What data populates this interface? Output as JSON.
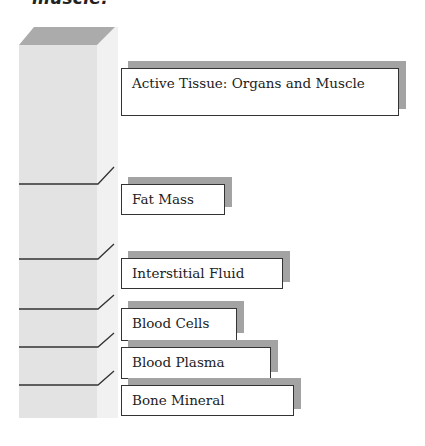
{
  "caption": "muscle.",
  "diagram": {
    "title_hidden": "",
    "column": {
      "face_color": "#e4e4e4",
      "top_color": "#a9a9a9",
      "side_color": "#f0f0f0"
    },
    "components": [
      {
        "id": "active",
        "label": "Active Tissue: Organs and Muscle"
      },
      {
        "id": "fat",
        "label": "Fat Mass"
      },
      {
        "id": "interstitial",
        "label": "Interstitial Fluid"
      },
      {
        "id": "blood_cells",
        "label": "Blood Cells"
      },
      {
        "id": "plasma",
        "label": "Blood Plasma"
      },
      {
        "id": "bone",
        "label": "Bone Mineral"
      }
    ]
  }
}
